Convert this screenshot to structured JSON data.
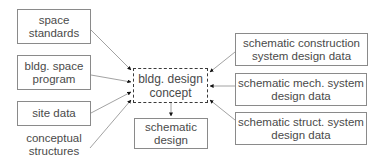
{
  "diagram": {
    "center": {
      "label_line1": "bldg. design",
      "label_line2": "concept",
      "style": "dashed"
    },
    "inputs_left": [
      {
        "id": "space-standards",
        "line1": "space",
        "line2": "standards"
      },
      {
        "id": "bldg-space-program",
        "line1": "bldg. space",
        "line2": "program"
      },
      {
        "id": "site-data",
        "line1": "site data",
        "line2": ""
      },
      {
        "id": "conceptual-structures",
        "line1": "conceptual",
        "line2": "structures",
        "boxed": false
      }
    ],
    "inputs_right": [
      {
        "id": "schematic-construction",
        "line1": "schematic construction",
        "line2": "system design data"
      },
      {
        "id": "schematic-mech",
        "line1": "schematic mech. system",
        "line2": "design data"
      },
      {
        "id": "schematic-struct",
        "line1": "schematic struct. system",
        "line2": "design data"
      }
    ],
    "output": {
      "id": "schematic-design",
      "line1": "schematic",
      "line2": "design"
    },
    "colors": {
      "box_border": "#8a8a8a",
      "arrow": "#111111",
      "line": "#8a8a8a",
      "text": "#4a4a4a"
    }
  }
}
